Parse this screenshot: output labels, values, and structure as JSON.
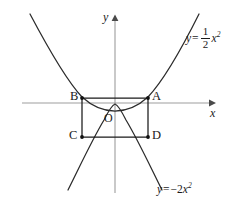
{
  "figure": {
    "kind": "math-diagram",
    "background_color": "#ffffff",
    "ink_color": "#1a1a1a",
    "axis_color": "#9a9a9a",
    "axes": {
      "x_label": "x",
      "y_label": "y",
      "origin_label": "O",
      "x_axis_arrow": true,
      "y_axis_arrow": true
    },
    "points": [
      {
        "name": "A",
        "label": "A",
        "x": 148,
        "y": 98
      },
      {
        "name": "B",
        "label": "B",
        "x": 82,
        "y": 98
      },
      {
        "name": "C",
        "label": "C",
        "x": 82,
        "y": 137
      },
      {
        "name": "D",
        "label": "D",
        "x": 148,
        "y": 137
      }
    ],
    "curves": [
      {
        "name": "upward-parabola",
        "equation_text": "y = (1/2)x^2",
        "coefficient_numerator": "1",
        "coefficient_denominator": "2",
        "variable": "x",
        "exponent": "2"
      },
      {
        "name": "downward-parabola",
        "equation_text": "y = -2x^2",
        "coefficient": "-2",
        "variable": "x",
        "exponent": "2"
      }
    ],
    "labels": {
      "eq_top": {
        "lhs": "y",
        "equals": "=",
        "num": "1",
        "den": "2",
        "var": "x",
        "sup": "2"
      },
      "eq_bottom": {
        "lhs": "y",
        "equals": "=",
        "coef": "−2",
        "var": "x",
        "sup": "2"
      }
    },
    "rectangle": {
      "name": "inscribed-rectangle",
      "vertices": [
        "B",
        "A",
        "D",
        "C"
      ]
    }
  }
}
